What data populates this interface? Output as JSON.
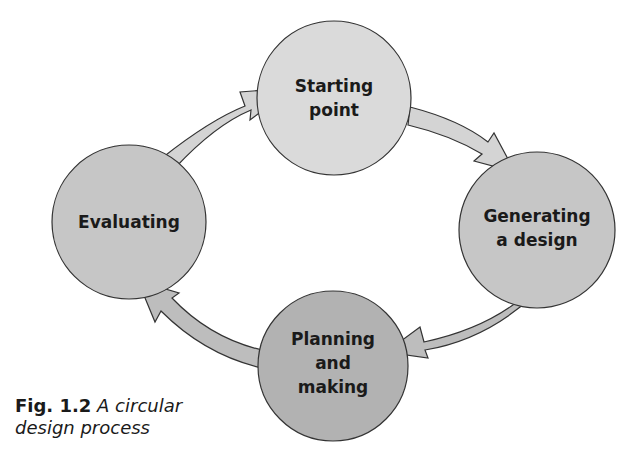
{
  "diagram": {
    "title": "A circular design process",
    "nodes": [
      {
        "id": "starting",
        "label_lines": [
          "Starting",
          "point"
        ],
        "fill": "#dadada"
      },
      {
        "id": "generating",
        "label_lines": [
          "Generating",
          "a design"
        ],
        "fill": "#c6c6c6"
      },
      {
        "id": "planning",
        "label_lines": [
          "Planning",
          "and",
          "making"
        ],
        "fill": "#b2b2b2"
      },
      {
        "id": "evaluating",
        "label_lines": [
          "Evaluating"
        ],
        "fill": "#c6c6c6"
      }
    ],
    "edges": [
      {
        "from": "evaluating",
        "to": "starting"
      },
      {
        "from": "starting",
        "to": "generating"
      },
      {
        "from": "generating",
        "to": "planning"
      },
      {
        "from": "planning",
        "to": "evaluating"
      }
    ]
  },
  "caption": {
    "fig_label": "Fig. 1.2",
    "line1": "A circular",
    "line2": "design process"
  }
}
